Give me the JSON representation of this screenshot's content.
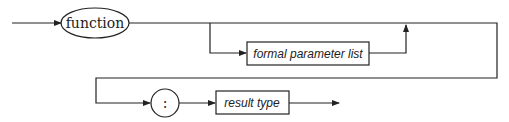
{
  "diagram": {
    "type": "syntax-diagram",
    "keyword": "function",
    "nonterminal_params": "formal parameter list",
    "terminal_colon": ":",
    "nonterminal_result": "result type"
  }
}
